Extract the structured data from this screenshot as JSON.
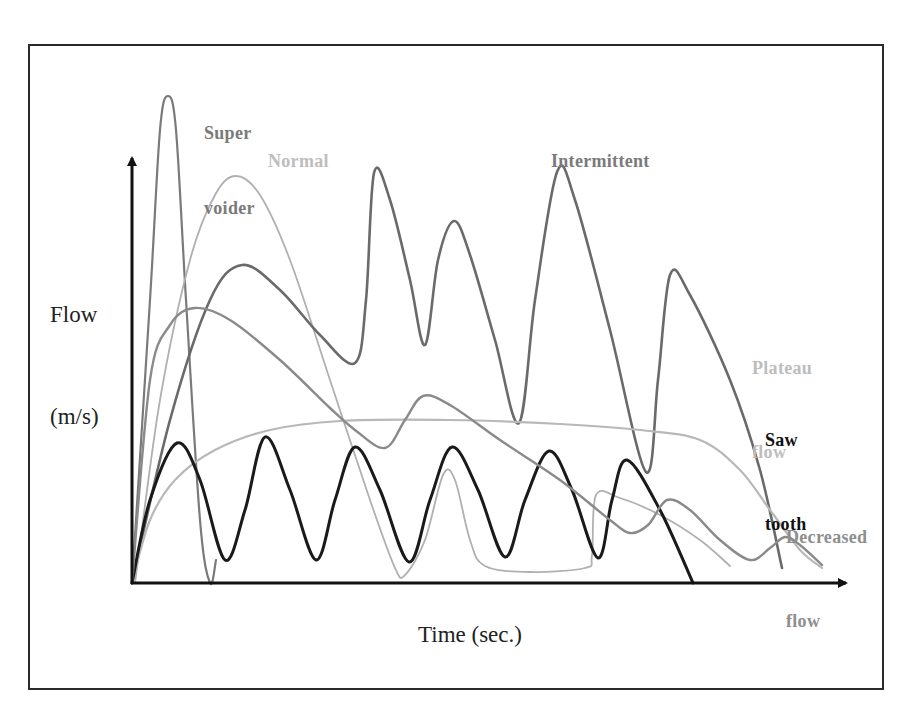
{
  "figure": {
    "y_axis_title_line1": "Flow",
    "y_axis_title_line2": "(m/s)",
    "x_axis_title": "Time (sec.)"
  },
  "labels": {
    "super_voider_1": "Super",
    "super_voider_2": "voider",
    "normal": "Normal",
    "intermittent": "Intermittent",
    "plateau_1": "Plateau",
    "plateau_2": "flow",
    "saw_tooth_1": "Saw",
    "saw_tooth_2": "tooth",
    "decreased_1": "Decreased",
    "decreased_2": "flow"
  },
  "colors": {
    "super_voider": "#7a7a7a",
    "normal": "#b0b0b0",
    "intermittent": "#6a6a6a",
    "plateau": "#b8b8b8",
    "saw_tooth": "#1a1a1a",
    "decreased": "#8a8a8a",
    "axis": "#111111"
  },
  "chart_data": {
    "type": "line",
    "title": "",
    "xlabel": "Time (sec.)",
    "ylabel": "Flow (m/s)",
    "grid": false,
    "legend_position": "inline labels near curves",
    "axes_pixels": {
      "origin": [
        132,
        583
      ],
      "x_end": [
        852,
        583
      ],
      "y_end": [
        132,
        153
      ]
    },
    "series": [
      {
        "name": "Super voider",
        "key": "super_voider",
        "points": [
          [
            132,
            583
          ],
          [
            150,
            300
          ],
          [
            160,
            130
          ],
          [
            168,
            96
          ],
          [
            176,
            130
          ],
          [
            186,
            300
          ],
          [
            200,
            520
          ],
          [
            210,
            583
          ],
          [
            216,
            560
          ]
        ]
      },
      {
        "name": "Normal",
        "key": "normal",
        "points": [
          [
            135,
            583
          ],
          [
            160,
            400
          ],
          [
            190,
            260
          ],
          [
            215,
            195
          ],
          [
            236,
            176
          ],
          [
            260,
            195
          ],
          [
            290,
            260
          ],
          [
            330,
            380
          ],
          [
            370,
            500
          ],
          [
            395,
            568
          ],
          [
            405,
            575
          ],
          [
            425,
            540
          ],
          [
            443,
            475
          ],
          [
            455,
            480
          ],
          [
            470,
            540
          ],
          [
            485,
            566
          ],
          [
            530,
            572
          ],
          [
            585,
            568
          ],
          [
            592,
            555
          ],
          [
            596,
            495
          ],
          [
            620,
            498
          ],
          [
            660,
            515
          ],
          [
            700,
            540
          ],
          [
            730,
            566
          ]
        ]
      },
      {
        "name": "Intermittent",
        "key": "intermittent",
        "points": [
          [
            132,
            583
          ],
          [
            170,
            420
          ],
          [
            210,
            300
          ],
          [
            242,
            265
          ],
          [
            280,
            290
          ],
          [
            320,
            335
          ],
          [
            355,
            363
          ],
          [
            366,
            300
          ],
          [
            374,
            173
          ],
          [
            390,
            200
          ],
          [
            410,
            280
          ],
          [
            425,
            345
          ],
          [
            438,
            260
          ],
          [
            454,
            221
          ],
          [
            470,
            255
          ],
          [
            495,
            340
          ],
          [
            519,
            423
          ],
          [
            535,
            300
          ],
          [
            557,
            172
          ],
          [
            575,
            200
          ],
          [
            610,
            330
          ],
          [
            646,
            472
          ],
          [
            658,
            380
          ],
          [
            670,
            275
          ],
          [
            690,
            295
          ],
          [
            730,
            380
          ],
          [
            760,
            470
          ],
          [
            782,
            568
          ]
        ]
      },
      {
        "name": "Plateau flow",
        "key": "plateau",
        "points": [
          [
            132,
            583
          ],
          [
            150,
            520
          ],
          [
            175,
            480
          ],
          [
            215,
            450
          ],
          [
            270,
            430
          ],
          [
            340,
            421
          ],
          [
            450,
            420
          ],
          [
            560,
            424
          ],
          [
            640,
            430
          ],
          [
            700,
            440
          ],
          [
            740,
            470
          ],
          [
            770,
            510
          ],
          [
            800,
            550
          ],
          [
            822,
            568
          ]
        ]
      },
      {
        "name": "Saw tooth",
        "key": "saw_tooth",
        "points": [
          [
            132,
            583
          ],
          [
            150,
            500
          ],
          [
            177,
            443
          ],
          [
            200,
            480
          ],
          [
            225,
            560
          ],
          [
            245,
            510
          ],
          [
            265,
            437
          ],
          [
            290,
            490
          ],
          [
            316,
            560
          ],
          [
            335,
            500
          ],
          [
            355,
            447
          ],
          [
            380,
            490
          ],
          [
            409,
            562
          ],
          [
            430,
            500
          ],
          [
            452,
            447
          ],
          [
            478,
            490
          ],
          [
            505,
            557
          ],
          [
            525,
            500
          ],
          [
            549,
            451
          ],
          [
            572,
            490
          ],
          [
            598,
            558
          ],
          [
            612,
            500
          ],
          [
            627,
            460
          ],
          [
            660,
            510
          ],
          [
            693,
            583
          ]
        ]
      },
      {
        "name": "Decreased flow",
        "key": "decreased",
        "points": [
          [
            132,
            583
          ],
          [
            150,
            380
          ],
          [
            170,
            325
          ],
          [
            195,
            308
          ],
          [
            230,
            320
          ],
          [
            280,
            360
          ],
          [
            330,
            408
          ],
          [
            355,
            430
          ],
          [
            385,
            448
          ],
          [
            405,
            420
          ],
          [
            423,
            396
          ],
          [
            450,
            405
          ],
          [
            500,
            440
          ],
          [
            560,
            480
          ],
          [
            610,
            520
          ],
          [
            630,
            533
          ],
          [
            648,
            525
          ],
          [
            667,
            500
          ],
          [
            690,
            510
          ],
          [
            720,
            540
          ],
          [
            750,
            560
          ],
          [
            770,
            548
          ],
          [
            785,
            537
          ],
          [
            800,
            545
          ],
          [
            822,
            565
          ]
        ]
      }
    ]
  }
}
